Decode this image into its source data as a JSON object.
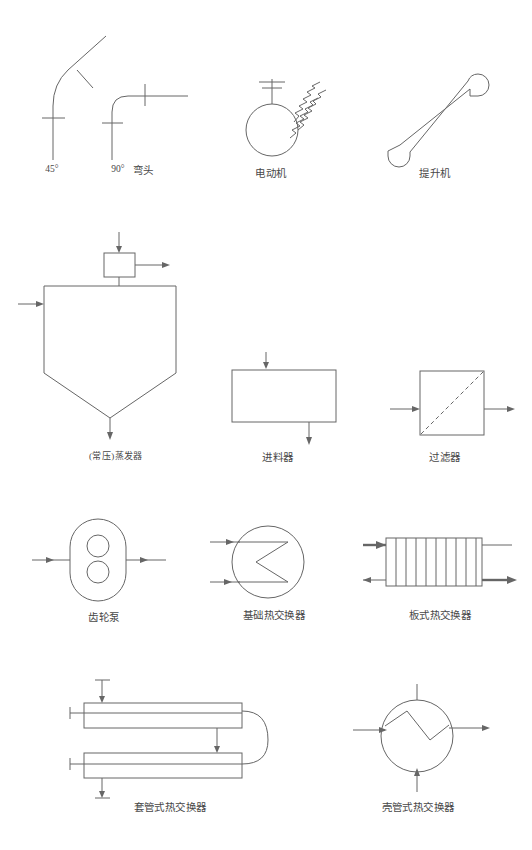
{
  "page": {
    "background_color": "#ffffff",
    "line_color": "#666666",
    "text_color": "#484848",
    "width": 532,
    "height": 850
  },
  "symbols": [
    {
      "id": "elbow-45",
      "label": "45°",
      "icon": "pipe-elbow-45-icon",
      "row": 1,
      "description": "斜管弯头 45 度，带两处管件标记"
    },
    {
      "id": "elbow-90",
      "label": "90°",
      "icon": "pipe-elbow-90-icon",
      "row": 1,
      "description": "直角弯头 90 度，带两处管件标记"
    },
    {
      "id": "elbow-group",
      "label": "弯头",
      "icon": "elbow-group-label-icon",
      "row": 1,
      "description": "弯头类别名称"
    },
    {
      "id": "electric-motor",
      "label": "电动机",
      "icon": "electric-motor-icon",
      "row": 1,
      "description": "圆形机体，顶部轴线与双横杠，右上三条锯齿线"
    },
    {
      "id": "elevator-hoist",
      "label": "提升机",
      "icon": "elevator-hoist-icon",
      "row": 1,
      "description": "斜置长槽形提升机，两端半圆斗"
    },
    {
      "id": "atmospheric-evaporator",
      "label": "(常压)蒸发器",
      "icon": "evaporator-icon",
      "row": 2,
      "description": "上方小方框分离器，主体五边形锥底容器，左侧进料，底部出料"
    },
    {
      "id": "feeder",
      "label": "进料器",
      "icon": "feeder-icon",
      "row": 2,
      "description": "矩形箱体，顶部进料箭头，底部出料箭头"
    },
    {
      "id": "filter",
      "label": "过滤器",
      "icon": "filter-icon",
      "row": 2,
      "description": "正方形壳体，内含虚线滤网对角线，左进右出"
    },
    {
      "id": "gear-pump",
      "label": "齿轮泵",
      "icon": "gear-pump-icon",
      "row": 3,
      "description": "圆角矩形泵壳，内含上下两个齿轮圆，左进右出"
    },
    {
      "id": "basic-heat-exchanger",
      "label": "基础热交换器",
      "icon": "basic-heat-exchanger-icon",
      "row": 3,
      "description": "圆形壳体，内含 Z 形折流板，左侧两路进料"
    },
    {
      "id": "plate-heat-exchanger",
      "label": "板式热交换器",
      "icon": "plate-heat-exchanger-icon",
      "row": 3,
      "description": "矩形壳体，内含九条竖向板片，四路进出物流"
    },
    {
      "id": "double-pipe-heat-exchanger",
      "label": "套管式热交换器",
      "icon": "double-pipe-heat-exchanger-icon",
      "row": 4,
      "description": "上下两段套管，右侧 U 形回弯连接，顶部与底部接管"
    },
    {
      "id": "shell-and-tube-heat-exchanger",
      "label": "壳管式热交换器",
      "icon": "shell-and-tube-heat-exchanger-icon",
      "row": 4,
      "description": "圆形壳体，内含 Z 形管束，四向接管箭头"
    }
  ]
}
